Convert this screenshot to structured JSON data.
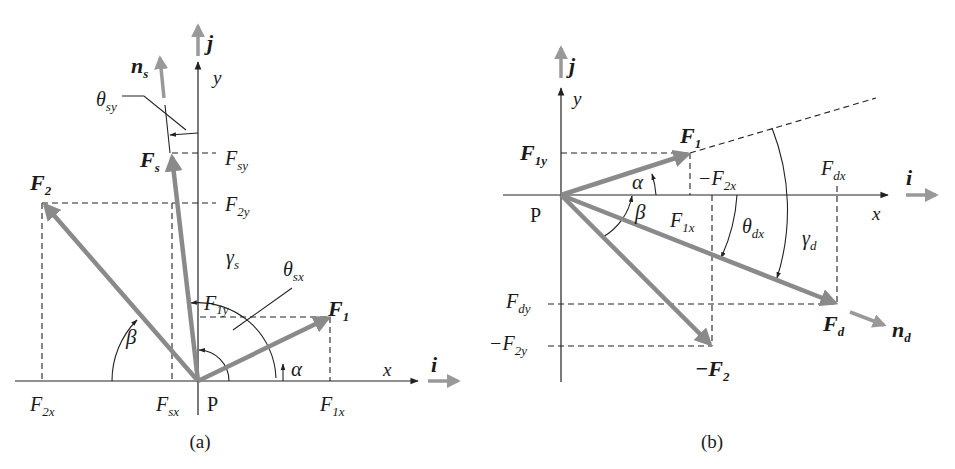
{
  "figure": {
    "panels": [
      {
        "id": "a",
        "caption": "(a)",
        "origin_label": "P",
        "axes": {
          "x": "x",
          "y": "y"
        },
        "unit_vectors": {
          "i": "i",
          "j": "j",
          "n": "n",
          "n_sub": "s"
        },
        "vectors": {
          "F1": {
            "main": "F",
            "sub": "1"
          },
          "F2": {
            "main": "F",
            "sub": "2"
          },
          "Fs": {
            "main": "F",
            "sub": "s"
          }
        },
        "components": {
          "F1x": {
            "main": "F",
            "sub": "1x"
          },
          "F1y": {
            "main": "F",
            "sub": "1y"
          },
          "F2x": {
            "main": "F",
            "sub": "2x"
          },
          "F2y": {
            "main": "F",
            "sub": "2y"
          },
          "Fsx": {
            "main": "F",
            "sub": "sx"
          },
          "Fsy": {
            "main": "F",
            "sub": "sy"
          }
        },
        "angles": {
          "alpha": "α",
          "beta": "β",
          "gamma": {
            "main": "γ",
            "sub": "s"
          },
          "theta_sx": {
            "main": "θ",
            "sub": "sx"
          },
          "theta_sy": {
            "main": "θ",
            "sub": "sy"
          }
        }
      },
      {
        "id": "b",
        "caption": "(b)",
        "origin_label": "P",
        "axes": {
          "x": "x",
          "y": "y"
        },
        "unit_vectors": {
          "i": "i",
          "j": "j",
          "n": "n",
          "n_sub": "d"
        },
        "vectors": {
          "F1": {
            "main": "F",
            "sub": "1"
          },
          "negF2": {
            "main": "−F",
            "sub": "2"
          },
          "Fd": {
            "main": "F",
            "sub": "d"
          }
        },
        "components": {
          "F1x": {
            "main": "F",
            "sub": "1x"
          },
          "F1y": {
            "main": "F",
            "sub": "1y"
          },
          "negF2x": {
            "main": "−F",
            "sub": "2x"
          },
          "negF2y": {
            "main": "−F",
            "sub": "2y"
          },
          "Fdx": {
            "main": "F",
            "sub": "dx"
          },
          "Fdy": {
            "main": "F",
            "sub": "dy"
          }
        },
        "angles": {
          "alpha": "α",
          "beta": "β",
          "gamma": {
            "main": "γ",
            "sub": "d"
          },
          "theta_dx": {
            "main": "θ",
            "sub": "dx"
          }
        }
      }
    ],
    "colors": {
      "vector": "#8a8a8a",
      "unit_vector": "#999999",
      "line": "#222222"
    }
  }
}
